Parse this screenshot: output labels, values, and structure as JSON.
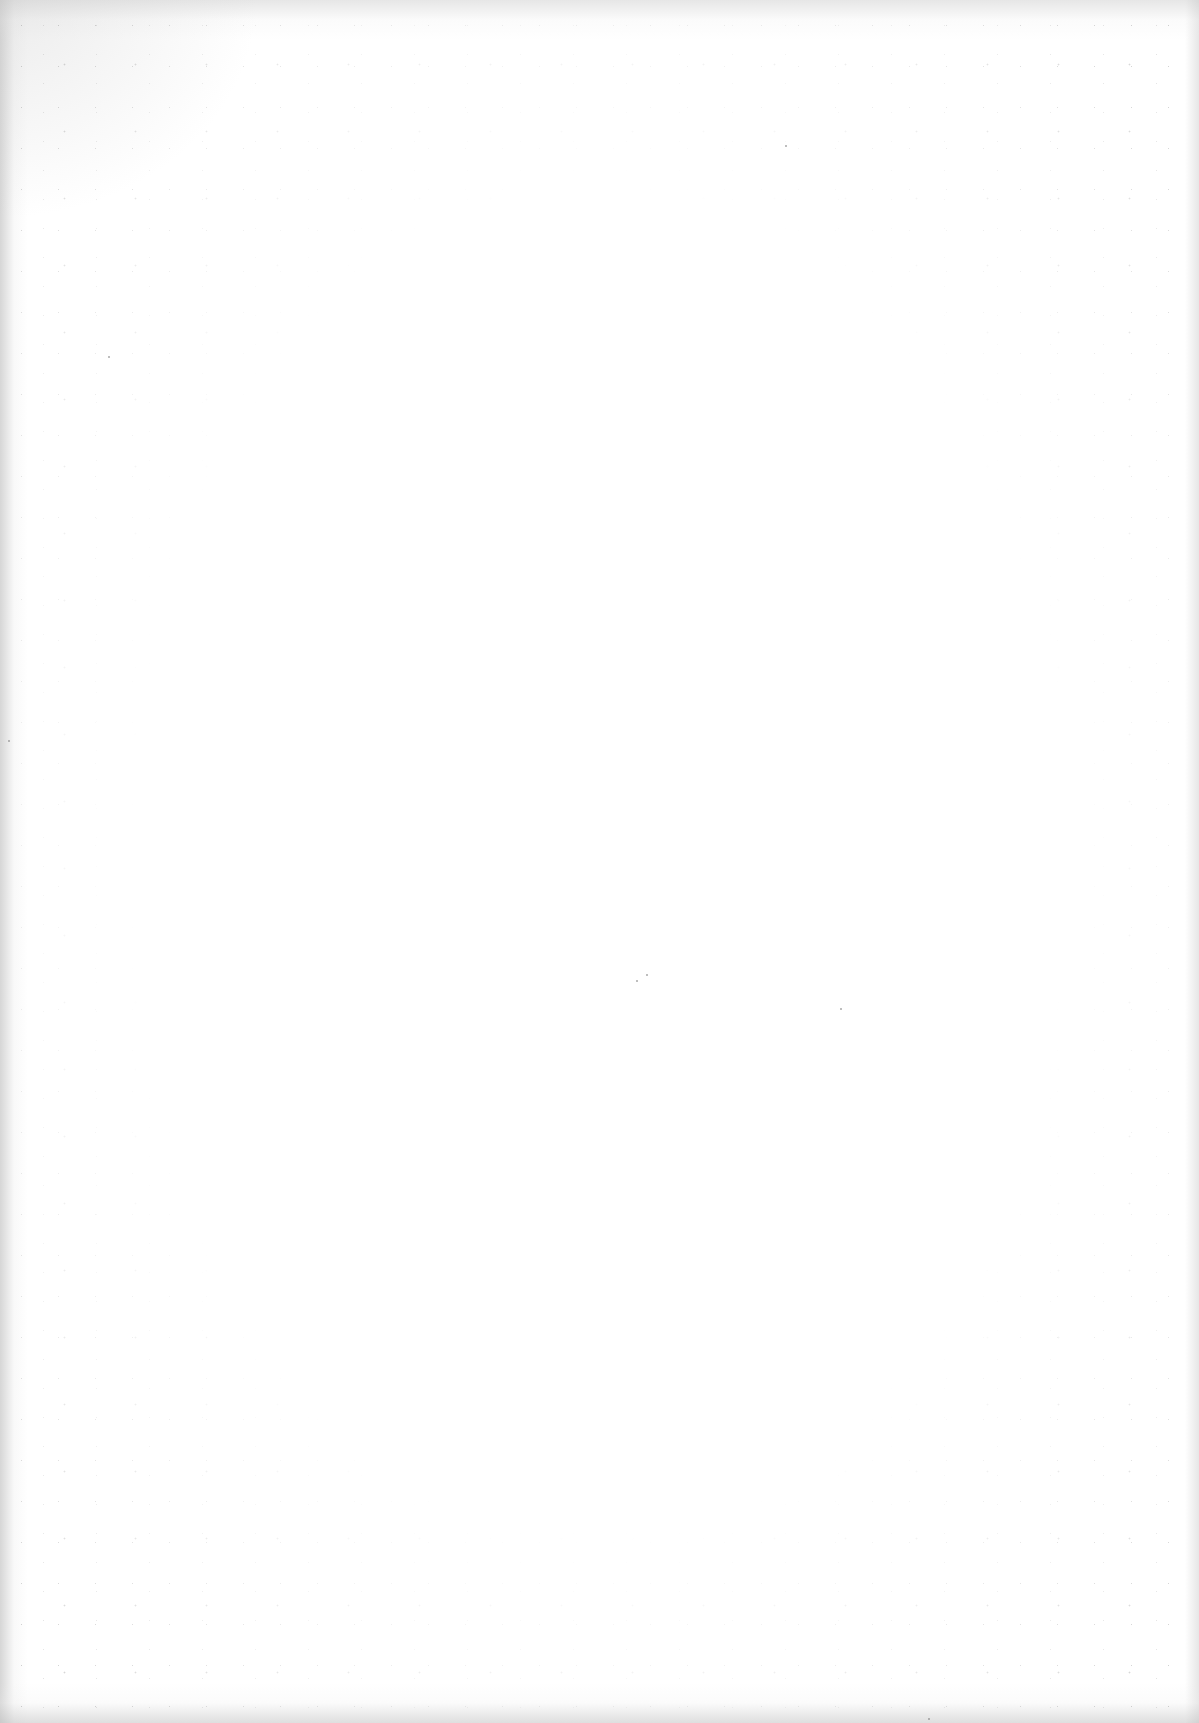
{
  "document": {
    "type": "scanned-blank-page",
    "content": ""
  }
}
